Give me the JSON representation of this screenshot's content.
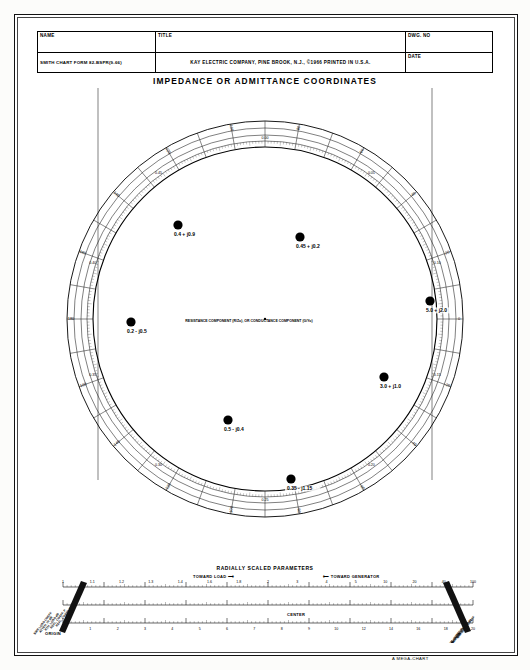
{
  "document": {
    "title": "IMPEDANCE OR ADMITTANCE COORDINATES",
    "form_id": "SMITH CHART FORM 82-BSPR(9-66)",
    "publisher": "KAY ELECTRIC COMPANY, PINE BROOK, N.J.,  ©1966   PRINTED IN U.S.A.",
    "brand": "A MEGA-CHART"
  },
  "title_block": {
    "name_label": "NAME",
    "title_label": "TITLE",
    "dwg_label": "DWG. NO",
    "date_label": "DATE",
    "name_value": "",
    "title_value": "",
    "dwg_value": "",
    "date_value": ""
  },
  "chart": {
    "type": "smith-chart",
    "axis_label": "RESISTANCE COMPONENT (R/Zo), OR CONDUCTANCE COMPONENT (G/Yo)",
    "center_resistance": "1.0",
    "origin_label": "0",
    "infinity_label": "∞",
    "resistance_circles": [
      0.1,
      0.2,
      0.3,
      0.4,
      0.5,
      0.6,
      0.7,
      0.8,
      0.9,
      1.0,
      1.2,
      1.4,
      1.6,
      1.8,
      2.0,
      3.0,
      4.0,
      5.0,
      10.0,
      20.0,
      50.0
    ],
    "reactance_arcs": [
      0.1,
      0.2,
      0.3,
      0.4,
      0.5,
      0.6,
      0.7,
      0.8,
      0.9,
      1.0,
      1.2,
      1.4,
      1.6,
      1.8,
      2.0,
      3.0,
      4.0,
      5.0,
      10.0,
      20.0,
      50.0
    ],
    "outer_scales": [
      "ANGLE OF REFLECTION COEFFICIENT IN DEGREES",
      "WAVELENGTHS TOWARD GENERATOR",
      "WAVELENGTHS TOWARD LOAD"
    ],
    "wavelength_ticks": [
      "0.00",
      "0.05",
      "0.10",
      "0.15",
      "0.20",
      "0.25",
      "0.30",
      "0.35",
      "0.40",
      "0.45"
    ],
    "angle_ticks": [
      "0",
      "20",
      "40",
      "60",
      "80",
      "100",
      "120",
      "140",
      "160",
      "180",
      "-160",
      "-140",
      "-120",
      "-100",
      "-80",
      "-60",
      "-40",
      "-20"
    ]
  },
  "chart_data": {
    "type": "scatter",
    "title": "IMPEDANCE OR ADMITTANCE COORDINATES",
    "coordinate_system": "smith-chart",
    "xlabel": "RESISTANCE COMPONENT (R/Zo), OR CONDUCTANCE COMPONENT (G/Yo)",
    "ylabel": "REACTANCE COMPONENT (jX/Zo), OR SUSCEPTANCE COMPONENT (jB/Yo)",
    "points": [
      {
        "id": "p1",
        "label": "0.4 + j0.9",
        "r": 0.4,
        "x": 0.9,
        "px": 178,
        "py": 225
      },
      {
        "id": "p2",
        "label": "0.45 + j0.2",
        "r": 0.45,
        "x": 0.2,
        "px": 300,
        "py": 237
      },
      {
        "id": "p3",
        "label": "0.2 - j0.5",
        "r": 0.2,
        "x": -0.5,
        "px": 131,
        "py": 322
      },
      {
        "id": "p4",
        "label": "0.5 - j0.4",
        "r": 0.5,
        "x": -0.4,
        "px": 228,
        "py": 420
      },
      {
        "id": "p5",
        "label": "0.35 - j1.15",
        "r": 0.35,
        "x": -1.15,
        "px": 291,
        "py": 479
      },
      {
        "id": "p6",
        "label": "3.0 + j1.0",
        "r": 3.0,
        "x": 1.0,
        "px": 384,
        "py": 377
      },
      {
        "id": "p7",
        "label": "5.0 + j2.0",
        "r": 5.0,
        "x": 2.0,
        "px": 430,
        "py": 301
      }
    ]
  },
  "radial_params": {
    "heading": "RADIALLY SCALED PARAMETERS",
    "toward_load": "TOWARD LOAD ⟶",
    "toward_generator": "⟵ TOWARD GENERATOR",
    "origin_label": "ORIGIN",
    "center_label": "CENTER",
    "left_scale_names": [
      "SWR LOSS COEFF",
      "ATTEN. IN dB",
      "RTN. LOSS dB",
      "REFL. COEFF. P",
      "REFL. COEFF. E or I"
    ],
    "right_scale_names": [
      "TRANSM. COEFF. P",
      "TRANSM. COEFF. E or I",
      "STANDING WAVE LOSS COEFF",
      "S.W. PEAK (CONST. P)",
      "S.W. LOSS COEFF"
    ],
    "ruler_top_ticks": [
      "1",
      "1.1",
      "1.2",
      "1.3",
      "1.4",
      "1.6",
      "1.8",
      "2",
      "3",
      "4",
      "5",
      "10",
      "20",
      "40",
      "100"
    ],
    "ruler_bottom_ticks": [
      "0",
      "1",
      "2",
      "3",
      "4",
      "5",
      "6",
      "7",
      "8",
      "9",
      "10",
      "12",
      "14",
      "16",
      "18",
      "20"
    ]
  },
  "colors": {
    "ink": "#111111",
    "grid": "#333333",
    "paper": "#ffffff",
    "marker": "#000000"
  }
}
